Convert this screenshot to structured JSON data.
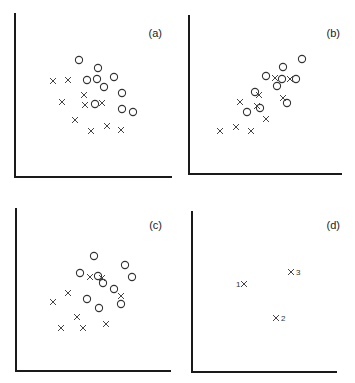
{
  "chart_data": [
    {
      "type": "scatter",
      "panel_label": "(a)",
      "xlabel": "",
      "ylabel": "",
      "grid": false,
      "axes_px": {
        "x0": 15,
        "y0": 177,
        "x1": 172,
        "ytop": 13
      },
      "series": [
        {
          "name": "circles",
          "marker": "o",
          "points": [
            [
              79,
              60
            ],
            [
              98,
              68
            ],
            [
              87,
              80
            ],
            [
              97,
              79
            ],
            [
              114,
              77
            ],
            [
              104,
              87
            ],
            [
              122,
              93
            ],
            [
              95,
              104
            ],
            [
              122,
              109
            ],
            [
              133,
              112
            ]
          ]
        },
        {
          "name": "crosses",
          "marker": "x",
          "points": [
            [
              53,
              81
            ],
            [
              68,
              80
            ],
            [
              84,
              95
            ],
            [
              62,
              102
            ],
            [
              85,
              105
            ],
            [
              102,
              103
            ],
            [
              75,
              120
            ],
            [
              107,
              126
            ],
            [
              91,
              131
            ],
            [
              121,
              130
            ]
          ]
        }
      ]
    },
    {
      "type": "scatter",
      "panel_label": "(b)",
      "xlabel": "",
      "ylabel": "",
      "grid": false,
      "axes_px": {
        "x0": 189,
        "y0": 174,
        "x1": 342,
        "ytop": 15
      },
      "series": [
        {
          "name": "circles",
          "marker": "o",
          "points": [
            [
              302,
              59
            ],
            [
              283,
              67
            ],
            [
              266,
              76
            ],
            [
              282,
              79
            ],
            [
              296,
              79
            ],
            [
              277,
              86
            ],
            [
              255,
              92
            ],
            [
              260,
              108
            ],
            [
              247,
              112
            ],
            [
              287,
              103
            ]
          ]
        },
        {
          "name": "crosses",
          "marker": "x",
          "points": [
            [
              275,
              78
            ],
            [
              290,
              79
            ],
            [
              259,
              95
            ],
            [
              240,
              102
            ],
            [
              257,
              106
            ],
            [
              283,
              98
            ],
            [
              266,
              119
            ],
            [
              220,
              131
            ],
            [
              236,
              127
            ],
            [
              251,
              131
            ]
          ]
        }
      ]
    },
    {
      "type": "scatter",
      "panel_label": "(c)",
      "xlabel": "",
      "ylabel": "",
      "grid": false,
      "axes_px": {
        "x0": 16,
        "y0": 371,
        "x1": 171,
        "ytop": 208
      },
      "series": [
        {
          "name": "circles",
          "marker": "o",
          "points": [
            [
              94,
              256
            ],
            [
              125,
              265
            ],
            [
              80,
              273
            ],
            [
              98,
              276
            ],
            [
              132,
              277
            ],
            [
              103,
              283
            ],
            [
              114,
              289
            ],
            [
              87,
              299
            ],
            [
              121,
              304
            ],
            [
              99,
              308
            ]
          ]
        },
        {
          "name": "crosses",
          "marker": "x",
          "points": [
            [
              90,
              277
            ],
            [
              102,
              278
            ],
            [
              121,
              296
            ],
            [
              68,
              293
            ],
            [
              53,
              302
            ],
            [
              77,
              317
            ],
            [
              61,
              328
            ],
            [
              83,
              328
            ],
            [
              106,
              324
            ]
          ]
        }
      ]
    },
    {
      "type": "scatter",
      "panel_label": "(d)",
      "xlabel": "",
      "ylabel": "",
      "grid": false,
      "axes_px": {
        "x0": 192,
        "y0": 372,
        "x1": 337,
        "ytop": 211
      },
      "series": [
        {
          "name": "labeled crosses",
          "marker": "x",
          "points": [
            [
              244,
              284
            ],
            [
              276,
              318
            ],
            [
              291,
              272
            ]
          ],
          "labels": [
            "1",
            "2",
            "3"
          ]
        }
      ]
    }
  ],
  "panels": {
    "a": {
      "label": "(a)"
    },
    "b": {
      "label": "(b)"
    },
    "c": {
      "label": "(c)"
    },
    "d": {
      "label": "(d)",
      "point_labels": [
        "1",
        "2",
        "3"
      ]
    }
  }
}
